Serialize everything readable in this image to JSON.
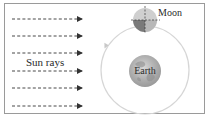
{
  "diagram": {
    "labels": {
      "sun_rays": "Sun rays",
      "moon": "Moon",
      "earth": "Earth"
    },
    "sun_rays": {
      "count": 6,
      "direction": "right",
      "style": "dashed-arrow"
    },
    "orbit": {
      "shape": "circle",
      "direction": "counterclockwise"
    },
    "colors": {
      "border": "#9a9a9a",
      "ray": "#333333",
      "orbit": "#d6d6d6",
      "moon_lit": "#c8c8c8",
      "moon_dark": "#7a7a7a",
      "earth": "#b5b5b5",
      "text": "#2a2a2a"
    }
  }
}
